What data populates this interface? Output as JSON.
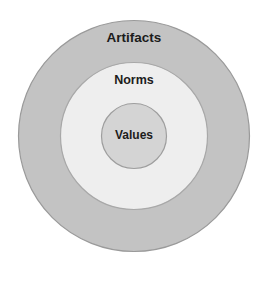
{
  "diagram": {
    "type": "concentric-circles",
    "background_color": "#ffffff",
    "center": {
      "x": 134,
      "y": 136
    },
    "rings": [
      {
        "name": "artifacts",
        "label": "Artifacts",
        "level": 1,
        "position": "outer",
        "radius": 128,
        "fill_color": "#c3c3c3",
        "stroke_color": "#9a9a9a",
        "label_x": 134,
        "label_y": 38
      },
      {
        "name": "norms",
        "label": "Norms",
        "level": 2,
        "position": "middle",
        "radius": 74,
        "fill_color": "#eeeeee",
        "stroke_color": "#a8a8a8",
        "label_x": 134,
        "label_y": 81
      },
      {
        "name": "values",
        "label": "Values",
        "level": 3,
        "position": "inner",
        "radius": 33,
        "fill_color": "#d4d4d4",
        "stroke_color": "#9e9e9e",
        "label_x": 134,
        "label_y": 136
      }
    ]
  }
}
